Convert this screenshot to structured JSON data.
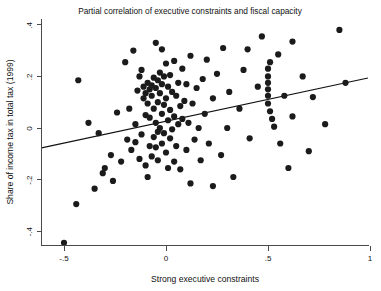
{
  "chart_data": {
    "type": "scatter",
    "title": "Partial correlation of executive constraints and fiscal capacity",
    "xlabel": "Strong executive constraints",
    "ylabel": "Share of income tax in total tax (1999)",
    "xlim": [
      -0.61,
      1.0
    ],
    "ylim": [
      -0.5,
      0.42
    ],
    "xticks": [
      -0.5,
      0,
      0.5,
      1
    ],
    "xticklabels": [
      "-.5",
      "0",
      ".5",
      "1"
    ],
    "yticks": [
      0.4,
      0.2,
      0,
      -0.2,
      -0.4
    ],
    "yticklabels": [
      ".4",
      ".2",
      "0",
      "-.2",
      "-.4"
    ],
    "grid": false,
    "legend": null,
    "marker": "filled-circle",
    "marker_color": "#1b1b1b",
    "marker_size": 3.1,
    "fit_line": {
      "type": "linear",
      "color": "#111111",
      "x_start": -0.61,
      "y_start": -0.077,
      "x_end": 0.99,
      "y_end": 0.194,
      "slope": 0.169,
      "intercept": 0.026
    },
    "points": [
      [
        -0.5,
        -0.445
      ],
      [
        -0.44,
        -0.295
      ],
      [
        -0.43,
        0.185
      ],
      [
        -0.35,
        -0.235
      ],
      [
        -0.3,
        -0.155
      ],
      [
        -0.31,
        -0.175
      ],
      [
        -0.27,
        -0.105
      ],
      [
        -0.26,
        -0.205
      ],
      [
        -0.24,
        0.06
      ],
      [
        -0.22,
        -0.13
      ],
      [
        -0.2,
        0.255
      ],
      [
        -0.19,
        -0.045
      ],
      [
        -0.18,
        0.075
      ],
      [
        -0.17,
        -0.085
      ],
      [
        -0.16,
        0.3
      ],
      [
        -0.15,
        0.015
      ],
      [
        -0.15,
        -0.055
      ],
      [
        -0.14,
        0.145
      ],
      [
        -0.13,
        -0.12
      ],
      [
        -0.13,
        0.2
      ],
      [
        -0.12,
        0.225
      ],
      [
        -0.12,
        -0.025
      ],
      [
        -0.11,
        0.115
      ],
      [
        -0.11,
        0.16
      ],
      [
        -0.1,
        0.135
      ],
      [
        -0.1,
        0.05
      ],
      [
        -0.1,
        -0.145
      ],
      [
        -0.09,
        0.175
      ],
      [
        -0.09,
        0.095
      ],
      [
        -0.09,
        -0.19
      ],
      [
        -0.08,
        0.15
      ],
      [
        -0.08,
        0.04
      ],
      [
        -0.08,
        -0.07
      ],
      [
        -0.07,
        0.165
      ],
      [
        -0.07,
        0.125
      ],
      [
        -0.07,
        -0.11
      ],
      [
        -0.06,
        0.195
      ],
      [
        -0.06,
        0.075
      ],
      [
        -0.06,
        -0.035
      ],
      [
        -0.05,
        0.33
      ],
      [
        -0.05,
        0.155
      ],
      [
        -0.05,
        0.02
      ],
      [
        -0.05,
        -0.075
      ],
      [
        -0.04,
        0.185
      ],
      [
        -0.04,
        0.1
      ],
      [
        -0.04,
        -0.015
      ],
      [
        -0.04,
        -0.125
      ],
      [
        -0.03,
        0.215
      ],
      [
        -0.03,
        0.135
      ],
      [
        -0.03,
        0.0
      ],
      [
        -0.02,
        0.305
      ],
      [
        -0.02,
        0.17
      ],
      [
        -0.02,
        0.055
      ],
      [
        -0.02,
        -0.06
      ],
      [
        -0.01,
        0.2
      ],
      [
        -0.01,
        0.09
      ],
      [
        -0.01,
        -0.02
      ],
      [
        0.0,
        0.25
      ],
      [
        0.0,
        0.115
      ],
      [
        0.0,
        -0.095
      ],
      [
        0.01,
        0.16
      ],
      [
        0.01,
        0.03
      ],
      [
        0.01,
        -0.155
      ],
      [
        0.02,
        0.205
      ],
      [
        0.02,
        0.07
      ],
      [
        0.02,
        -0.04
      ],
      [
        0.03,
        0.14
      ],
      [
        0.03,
        -0.005
      ],
      [
        0.04,
        0.26
      ],
      [
        0.04,
        0.045
      ],
      [
        0.04,
        -0.13
      ],
      [
        0.05,
        0.125
      ],
      [
        0.05,
        -0.07
      ],
      [
        0.06,
        0.175
      ],
      [
        0.06,
        0.015
      ],
      [
        0.07,
        0.085
      ],
      [
        0.07,
        -0.16
      ],
      [
        0.08,
        0.23
      ],
      [
        0.08,
        0.035
      ],
      [
        0.09,
        0.105
      ],
      [
        0.1,
        -0.085
      ],
      [
        0.1,
        0.17
      ],
      [
        0.11,
        0.02
      ],
      [
        0.12,
        0.28
      ],
      [
        0.12,
        -0.215
      ],
      [
        0.13,
        0.095
      ],
      [
        0.14,
        -0.045
      ],
      [
        0.15,
        0.155
      ],
      [
        0.16,
        0.0
      ],
      [
        0.17,
        -0.125
      ],
      [
        0.18,
        0.19
      ],
      [
        0.19,
        0.055
      ],
      [
        0.2,
        0.265
      ],
      [
        0.21,
        -0.06
      ],
      [
        0.23,
        0.115
      ],
      [
        0.25,
        0.21
      ],
      [
        0.27,
        -0.105
      ],
      [
        0.28,
        0.31
      ],
      [
        0.3,
        0.0
      ],
      [
        0.31,
        0.14
      ],
      [
        0.33,
        -0.19
      ],
      [
        0.36,
        0.075
      ],
      [
        0.38,
        0.225
      ],
      [
        0.41,
        -0.04
      ],
      [
        0.45,
        0.16
      ],
      [
        0.47,
        0.355
      ],
      [
        0.5,
        0.23
      ],
      [
        0.5,
        0.2
      ],
      [
        0.5,
        0.175
      ],
      [
        0.5,
        0.15
      ],
      [
        0.5,
        0.125
      ],
      [
        0.5,
        0.095
      ],
      [
        0.51,
        0.255
      ],
      [
        0.51,
        0.065
      ],
      [
        0.52,
        0.035
      ],
      [
        0.53,
        0.005
      ],
      [
        0.55,
        0.285
      ],
      [
        0.56,
        -0.06
      ],
      [
        0.58,
        0.125
      ],
      [
        0.6,
        -0.155
      ],
      [
        0.62,
        0.045
      ],
      [
        0.67,
        0.2
      ],
      [
        0.7,
        -0.09
      ],
      [
        0.72,
        0.12
      ],
      [
        0.78,
        0.015
      ],
      [
        0.85,
        0.38
      ],
      [
        0.88,
        0.175
      ],
      [
        -0.38,
        0.02
      ],
      [
        -0.33,
        -0.02
      ],
      [
        0.23,
        -0.225
      ],
      [
        0.4,
        0.305
      ],
      [
        0.62,
        0.335
      ]
    ]
  },
  "figure": {
    "title": "Partial correlation of executive constraints and fiscal capacity",
    "xlabel": "Strong executive constraints",
    "ylabel": "Share of income tax in total tax (1999)"
  }
}
